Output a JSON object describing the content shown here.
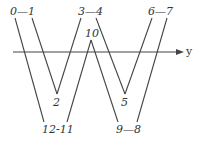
{
  "diagram": {
    "type": "zigzag-path-crossing-axis",
    "axis": {
      "label": "y",
      "y": 52,
      "x_start": 13,
      "x_end": 183
    },
    "colors": {
      "line": "#444444",
      "text": "#333333",
      "background": "#ffffff"
    },
    "labels": {
      "v0_1": "0—1",
      "v3_4": "3—4",
      "v6_7": "6—7",
      "v10": "10",
      "v2": "2",
      "v5": "5",
      "v12_11": "12-11",
      "v9_8": "9—8"
    },
    "vertices": {
      "0": [
        15,
        18
      ],
      "1": [
        32,
        18
      ],
      "2": [
        57,
        94
      ],
      "3": [
        81,
        18
      ],
      "4": [
        96,
        18
      ],
      "5": [
        125,
        94
      ],
      "6": [
        152,
        18
      ],
      "7": [
        167,
        18
      ],
      "8": [
        137,
        122
      ],
      "9": [
        118,
        122
      ],
      "10": [
        91,
        40
      ],
      "11": [
        67,
        122
      ],
      "12": [
        44,
        122
      ]
    },
    "segments": [
      [
        "0",
        "12"
      ],
      [
        "1",
        "2"
      ],
      [
        "2",
        "3"
      ],
      [
        "11",
        "10"
      ],
      [
        "10",
        "9"
      ],
      [
        "4",
        "5"
      ],
      [
        "5",
        "6"
      ],
      [
        "8",
        "7"
      ]
    ]
  }
}
